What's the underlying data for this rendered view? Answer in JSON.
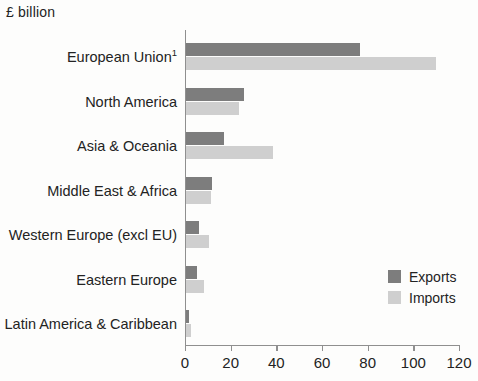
{
  "chart_data": {
    "type": "bar",
    "orientation": "horizontal",
    "title": "£ billion",
    "xlabel": "",
    "ylabel": "",
    "xlim": [
      0,
      120
    ],
    "xticks": [
      0,
      20,
      40,
      60,
      80,
      100,
      120
    ],
    "xtick_labels": [
      "0",
      "20",
      "40",
      "60",
      "80",
      "100",
      "120"
    ],
    "grid": false,
    "legend_position": "bottom-right",
    "categories": [
      "European Union¹",
      "North America",
      "Asia & Oceania",
      "Middle East & Africa",
      "Western Europe (excl EU)",
      "Eastern Europe",
      "Latin America & Caribbean"
    ],
    "series": [
      {
        "name": "Exports",
        "color": "#7d7d7d",
        "values": [
          76,
          25.5,
          16.5,
          11.5,
          5.5,
          5,
          1.5
        ]
      },
      {
        "name": "Imports",
        "color": "#cfcfcf",
        "values": [
          109.5,
          23,
          38,
          11,
          10,
          8,
          2
        ]
      }
    ]
  },
  "legend": {
    "entries": [
      {
        "label": "Exports"
      },
      {
        "label": "Imports"
      }
    ]
  },
  "category_labels": [
    {
      "text": "European Union",
      "sup": "1"
    },
    {
      "text": "North America",
      "sup": ""
    },
    {
      "text": "Asia & Oceania",
      "sup": ""
    },
    {
      "text": "Middle East & Africa",
      "sup": ""
    },
    {
      "text": "Western Europe (excl EU)",
      "sup": ""
    },
    {
      "text": "Eastern Europe",
      "sup": ""
    },
    {
      "text": "Latin America & Caribbean",
      "sup": ""
    }
  ]
}
